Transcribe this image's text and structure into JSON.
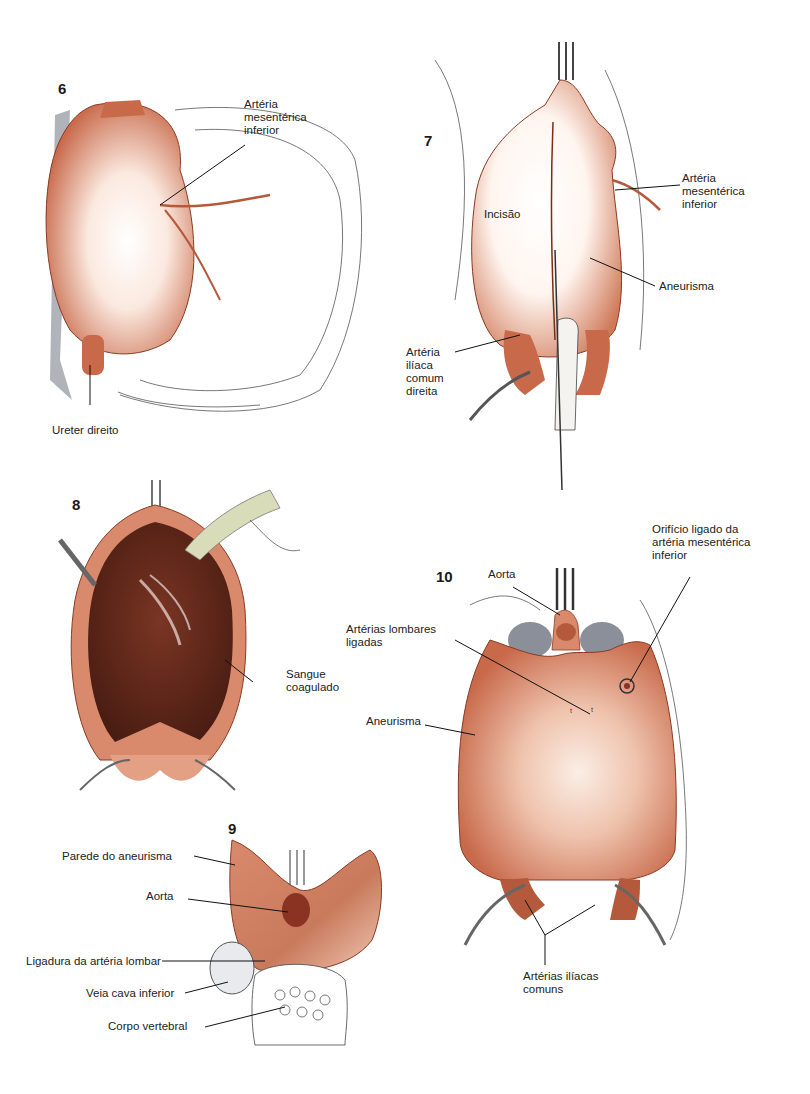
{
  "figures": [
    {
      "number": "6",
      "labels": {
        "ima": "Artéria\nmesentérica\ninferior",
        "ureter": "Ureter direito"
      }
    },
    {
      "number": "7",
      "labels": {
        "ima": "Artéria\nmesentérica\ninferior",
        "incision": "Incisão",
        "aneurysm": "Aneurisma",
        "iliac": "Artéria\nilíaca\ncomum\ndireita"
      }
    },
    {
      "number": "8",
      "labels": {
        "clot": "Sangue\ncoagulado"
      }
    },
    {
      "number": "9",
      "labels": {
        "wall": "Parede do aneurisma",
        "aorta": "Aorta",
        "lumbar": "Ligadura da artéria lombar",
        "ivc": "Veia cava inferior",
        "vertebra": "Corpo vertebral"
      }
    },
    {
      "number": "10",
      "labels": {
        "aorta": "Aorta",
        "orifice": "Orifício ligado da\nartéria mesentérica\ninferior",
        "lumbar": "Artérias lombares\nligadas",
        "aneurysm": "Aneurisma",
        "iliacs": "Artérias ilíacas\ncomuns"
      }
    }
  ],
  "colors": {
    "tissue": "#d98a6c",
    "tissue_dark": "#b5593c",
    "tissue_light": "#f6d9c9",
    "clot": "#5a2418",
    "tube": "#d9dcb8",
    "vessel_gray": "#8a8f99"
  }
}
